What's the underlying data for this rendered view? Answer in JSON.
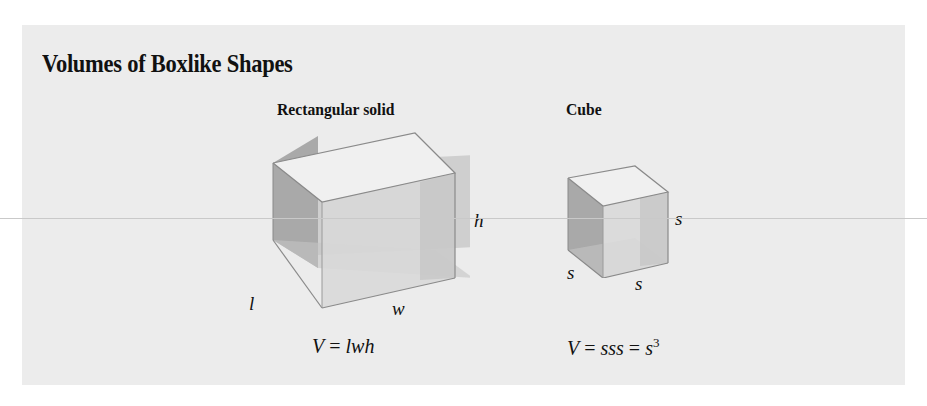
{
  "heading": {
    "title": "Volumes of Boxlike Shapes"
  },
  "shapes": [
    {
      "name": "Rectangular solid",
      "dimension_labels": {
        "length": "l",
        "width": "w",
        "height": "h"
      },
      "formula": {
        "lhs": "V",
        "eq": "=",
        "rhs": "lwh"
      }
    },
    {
      "name": "Cube",
      "dimension_labels": {
        "side_front": "s",
        "side_bottom": "s",
        "side_right": "s"
      },
      "formula": {
        "lhs": "V",
        "eq1": "=",
        "mid": "sss",
        "eq2": "=",
        "base": "s",
        "exp": "3"
      }
    }
  ],
  "colors": {
    "panel": "#ececec",
    "edge": "#8a8a8a",
    "left_face": "#a8a8a8",
    "top_face": "#efefef",
    "front_face": "#d6d6d6",
    "back_face": "#bdbdbd"
  }
}
